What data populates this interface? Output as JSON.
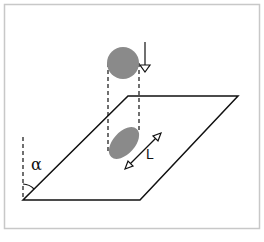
{
  "diagram": {
    "labels": {
      "angle": "α",
      "length": "L"
    },
    "colors": {
      "frame": "#c8c8c8",
      "stroke": "#111111",
      "drop_fill": "#8a8a8a"
    },
    "elements": {
      "falling_drop": "circle",
      "impact_spot": "ellipse on inclined plane",
      "arrow_fall": "downward arrow",
      "arrow_length": "double-headed arrow",
      "plane": "inclined parallelogram"
    }
  }
}
